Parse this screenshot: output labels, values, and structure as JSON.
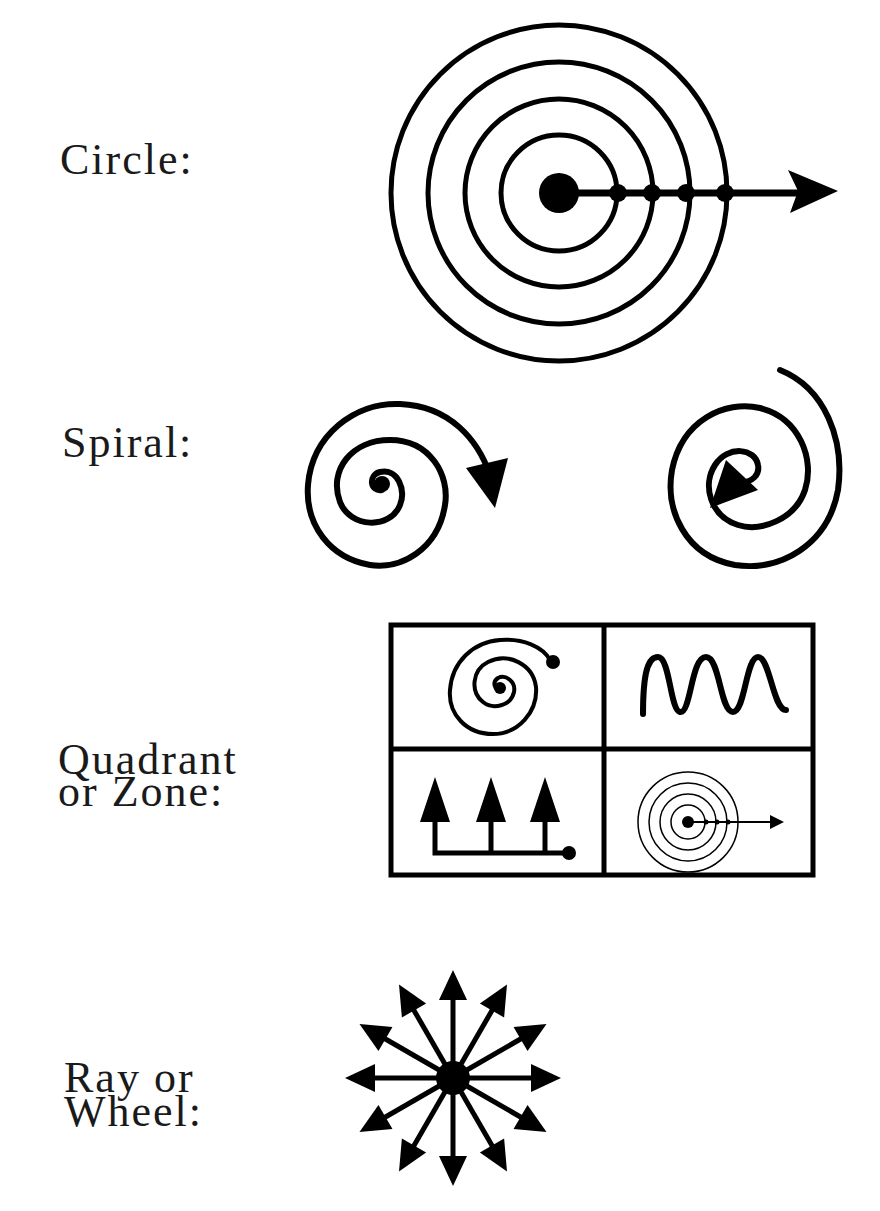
{
  "rows": [
    {
      "label_lines": [
        "Circle:"
      ],
      "figure": "concentric-circles-with-arrow"
    },
    {
      "label_lines": [
        "Spiral:"
      ],
      "figure": "two-spirals-with-arrows"
    },
    {
      "label_lines": [
        "Quadrant",
        "or Zone:"
      ],
      "figure": "four-quadrant-grid"
    },
    {
      "label_lines": [
        "Ray or",
        "Wheel:"
      ],
      "figure": "radiating-arrows-wheel"
    }
  ],
  "quadrants": [
    {
      "position": "top-left",
      "figure": "spiral-with-dot"
    },
    {
      "position": "top-right",
      "figure": "wave-line"
    },
    {
      "position": "bottom-left",
      "figure": "three-up-arrows-on-bracket"
    },
    {
      "position": "bottom-right",
      "figure": "mini-concentric-circles-with-arrow"
    }
  ],
  "colors": {
    "ink": "#000000",
    "background": "#ffffff",
    "text": "#1a1a1a"
  }
}
